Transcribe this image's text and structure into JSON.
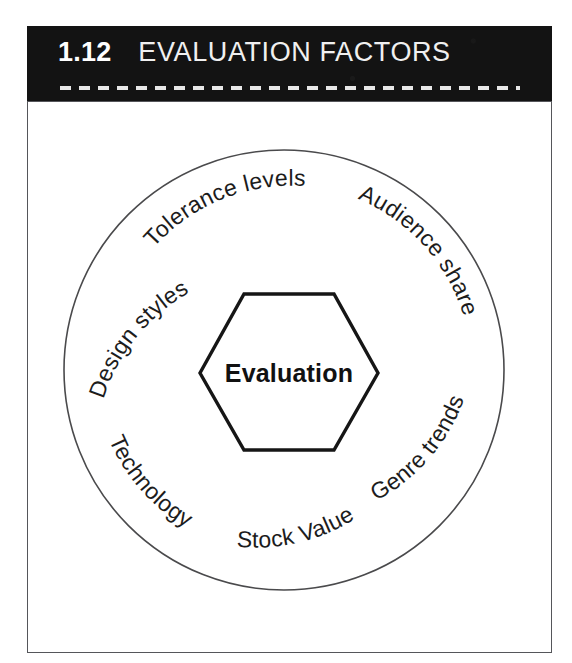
{
  "header": {
    "number": "1.12",
    "title": "EVALUATION FACTORS",
    "divider": "dashed-rule"
  },
  "diagram": {
    "type": "hub-and-ring",
    "center_label": "Evaluation",
    "center_shape": "hexagon",
    "ring_shape": "circle",
    "factors": [
      {
        "label": "Tolerance levels",
        "position": "top"
      },
      {
        "label": "Audience share",
        "position": "top-right"
      },
      {
        "label": "Genre trends",
        "position": "bottom-right"
      },
      {
        "label": "Stock Value",
        "position": "bottom"
      },
      {
        "label": "Technology",
        "position": "bottom-left"
      },
      {
        "label": "Design styles",
        "position": "top-left"
      }
    ]
  },
  "colors": {
    "banner_background": "#131313",
    "banner_text": "#ffffff",
    "frame_border": "#55565a",
    "ring_stroke": "#4a4a4c",
    "hex_stroke": "#161616",
    "label_text": "#1c1c1c",
    "page_background": "#ffffff"
  }
}
